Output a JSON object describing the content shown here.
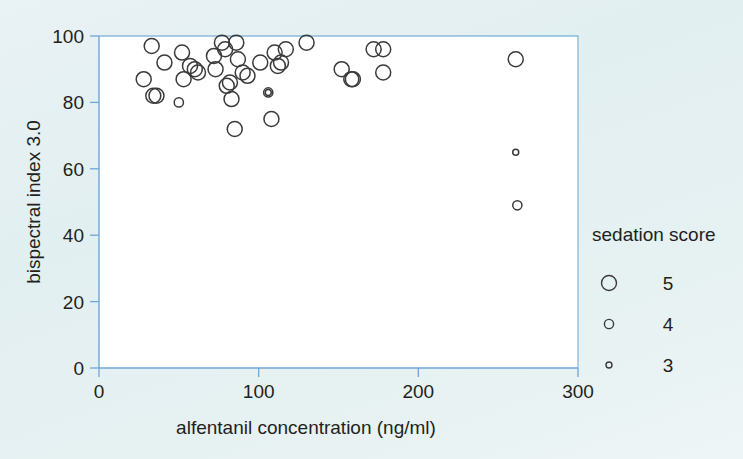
{
  "chart_data": {
    "type": "scatter",
    "title": "",
    "xlabel": "alfentanil concentration (ng/ml)",
    "ylabel": "bispectral index 3.0",
    "xlim": [
      0,
      300
    ],
    "ylim": [
      0,
      100
    ],
    "xticks": [
      0,
      100,
      200,
      300
    ],
    "yticks": [
      0,
      20,
      40,
      60,
      80,
      100
    ],
    "xtick_labels": [
      "0",
      "100",
      "200",
      "300"
    ],
    "ytick_labels": [
      "0",
      "20",
      "40",
      "60",
      "80",
      "100"
    ],
    "grid": false,
    "size_encoding": {
      "variable": "sedation score",
      "levels": [
        {
          "label": "5",
          "value": 5,
          "radius_px": 7.5
        },
        {
          "label": "4",
          "value": 4,
          "radius_px": 4.6
        },
        {
          "label": "3",
          "value": 3,
          "radius_px": 3.0
        }
      ]
    },
    "legend": {
      "title": "sedation score",
      "position": "right",
      "entries": [
        "5",
        "4",
        "3"
      ]
    },
    "series": [
      {
        "name": "patients",
        "marker": "open-circle",
        "color": "#3a3a3a",
        "points": [
          {
            "x": 28,
            "y": 87,
            "score": 5
          },
          {
            "x": 33,
            "y": 97,
            "score": 5
          },
          {
            "x": 34,
            "y": 82,
            "score": 5
          },
          {
            "x": 36,
            "y": 82,
            "score": 5
          },
          {
            "x": 41,
            "y": 92,
            "score": 5
          },
          {
            "x": 50,
            "y": 80,
            "score": 4
          },
          {
            "x": 52,
            "y": 95,
            "score": 5
          },
          {
            "x": 53,
            "y": 87,
            "score": 5
          },
          {
            "x": 57,
            "y": 91,
            "score": 5
          },
          {
            "x": 60,
            "y": 90,
            "score": 5
          },
          {
            "x": 62,
            "y": 89,
            "score": 5
          },
          {
            "x": 72,
            "y": 94,
            "score": 5
          },
          {
            "x": 73,
            "y": 90,
            "score": 5
          },
          {
            "x": 77,
            "y": 98,
            "score": 5
          },
          {
            "x": 79,
            "y": 96,
            "score": 5
          },
          {
            "x": 80,
            "y": 85,
            "score": 5
          },
          {
            "x": 82,
            "y": 86,
            "score": 5
          },
          {
            "x": 83,
            "y": 81,
            "score": 5
          },
          {
            "x": 85,
            "y": 72,
            "score": 5
          },
          {
            "x": 86,
            "y": 98,
            "score": 5
          },
          {
            "x": 87,
            "y": 93,
            "score": 5
          },
          {
            "x": 90,
            "y": 89,
            "score": 5
          },
          {
            "x": 93,
            "y": 88,
            "score": 5
          },
          {
            "x": 101,
            "y": 92,
            "score": 5
          },
          {
            "x": 106,
            "y": 83,
            "score": 4
          },
          {
            "x": 106,
            "y": 83,
            "score": 3
          },
          {
            "x": 108,
            "y": 75,
            "score": 5
          },
          {
            "x": 110,
            "y": 95,
            "score": 5
          },
          {
            "x": 112,
            "y": 91,
            "score": 5
          },
          {
            "x": 114,
            "y": 92,
            "score": 5
          },
          {
            "x": 117,
            "y": 96,
            "score": 5
          },
          {
            "x": 130,
            "y": 98,
            "score": 5
          },
          {
            "x": 152,
            "y": 90,
            "score": 5
          },
          {
            "x": 158,
            "y": 87,
            "score": 5
          },
          {
            "x": 159,
            "y": 87,
            "score": 5
          },
          {
            "x": 172,
            "y": 96,
            "score": 5
          },
          {
            "x": 178,
            "y": 96,
            "score": 5
          },
          {
            "x": 178,
            "y": 89,
            "score": 5
          },
          {
            "x": 261,
            "y": 93,
            "score": 5
          },
          {
            "x": 261,
            "y": 65,
            "score": 3
          },
          {
            "x": 262,
            "y": 49,
            "score": 4
          }
        ]
      }
    ]
  }
}
